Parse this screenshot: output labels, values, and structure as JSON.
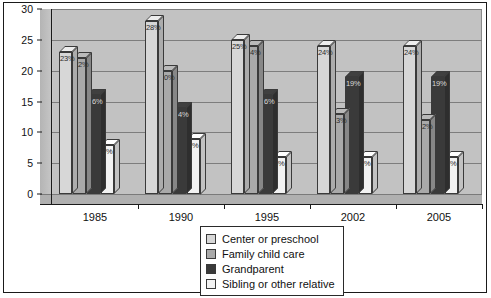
{
  "chart_data": {
    "type": "bar",
    "title": "",
    "xlabel": "",
    "ylabel": "",
    "categories": [
      "1985",
      "1990",
      "1995",
      "2002",
      "2005"
    ],
    "ylim": [
      0,
      30
    ],
    "yticks": [
      0,
      5,
      10,
      15,
      20,
      25,
      30
    ],
    "grid": true,
    "legend_position": "bottom-right",
    "value_label_suffix": "%",
    "series": [
      {
        "name": "Center or preschool",
        "color": "#d7d7d7",
        "values": [
          23,
          28,
          25,
          24,
          24
        ],
        "labels": [
          "23%",
          "28%",
          "25%",
          "24%",
          "24%"
        ]
      },
      {
        "name": "Family child care",
        "color": "#a9a9a9",
        "values": [
          22,
          20,
          24,
          13,
          12
        ],
        "labels": [
          "22%",
          "20%",
          "24%",
          "13%",
          "12%"
        ]
      },
      {
        "name": "Grandparent",
        "color": "#3a3a3a",
        "values": [
          16,
          14,
          16,
          19,
          19
        ],
        "labels": [
          "16%",
          "14%",
          "16%",
          "19%",
          "19%"
        ]
      },
      {
        "name": "Sibling or other relative",
        "color": "#f2f2f2",
        "values": [
          8,
          9,
          6,
          6,
          6
        ],
        "labels": [
          "8%",
          "9%",
          "6%",
          "6%",
          "6%"
        ]
      }
    ]
  },
  "legend": {
    "items": [
      {
        "label": "Center or preschool",
        "color": "#d7d7d7"
      },
      {
        "label": "Family child care",
        "color": "#a9a9a9"
      },
      {
        "label": "Grandparent",
        "color": "#3a3a3a"
      },
      {
        "label": "Sibling or other relative",
        "color": "#f2f2f2"
      }
    ]
  }
}
